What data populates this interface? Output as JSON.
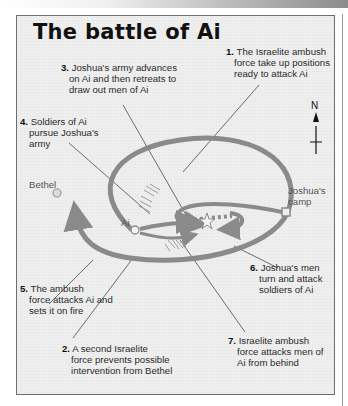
{
  "header": {
    "strip": "decorative gradient page header"
  },
  "map": {
    "title": "The battle of Ai",
    "compass": {
      "label": "N"
    },
    "places": {
      "bethel": "Bethel",
      "ai": "Ai",
      "camp_line1": "Joshua's",
      "camp_line2": "camp"
    },
    "annotations": [
      {
        "num": "1.",
        "lines": [
          "The Israelite ambush",
          "force take up positions",
          "ready to attack Ai"
        ]
      },
      {
        "num": "2.",
        "lines": [
          "A second Israelite",
          "force prevents possible",
          "intervention from Bethel"
        ]
      },
      {
        "num": "3.",
        "lines": [
          "Joshua's army advances",
          "on Ai and then retreats to",
          "draw out men of Ai"
        ]
      },
      {
        "num": "4.",
        "lines": [
          "Soldiers of Ai",
          "pursue Joshua's",
          "army"
        ]
      },
      {
        "num": "5.",
        "lines": [
          "The ambush",
          "force attacks Ai and",
          "sets it on fire"
        ]
      },
      {
        "num": "6.",
        "lines": [
          "Joshua's men",
          "turn and attack",
          "soldiers of Ai"
        ]
      },
      {
        "num": "7.",
        "lines": [
          "Israelite ambush",
          "force attacks men of",
          "Ai from behind"
        ]
      }
    ],
    "colors": {
      "route": "#8a8a8a",
      "leader": "#333333",
      "background": "#eeeeee",
      "border": "#6e6e6e"
    }
  }
}
